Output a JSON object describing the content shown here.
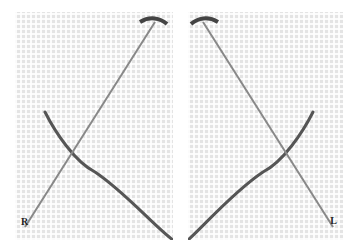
{
  "figure": {
    "panels": [
      {
        "id": "left",
        "label": "R",
        "description": "Needle crossing thread on even-weave fabric, right-handed stitch"
      },
      {
        "id": "right",
        "label": "L",
        "description": "Needle crossing thread on even-weave fabric, left-handed stitch"
      }
    ],
    "colors": {
      "fabric": "#e4e4e4",
      "thread": "#555555",
      "needle": "#777777"
    }
  }
}
